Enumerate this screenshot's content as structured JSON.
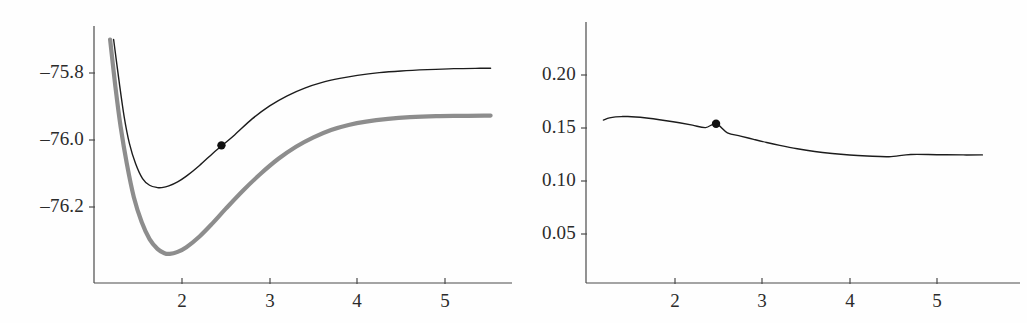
{
  "figure": {
    "background": "#fefefe",
    "panel_count": 2
  },
  "chart_data": [
    {
      "type": "line",
      "panel": "left",
      "title": "",
      "xlabel": "",
      "ylabel": "",
      "xlim": [
        1.15,
        5.55
      ],
      "ylim": [
        -76.36,
        -75.7
      ],
      "grid": false,
      "legend": "none",
      "xticks": [
        2,
        3,
        4,
        5
      ],
      "xtick_labels": [
        "2",
        "3",
        "4",
        "5"
      ],
      "yticks": [
        -75.8,
        -76.0,
        -76.2
      ],
      "ytick_labels": [
        "–75.8",
        "–76.0",
        "–76.2"
      ],
      "series": [
        {
          "name": "upper-curve",
          "style": "thin-black",
          "color": "#1c1c1c",
          "width": 1.4,
          "x": [
            1.22,
            1.28,
            1.34,
            1.4,
            1.47,
            1.55,
            1.63,
            1.72,
            1.77,
            1.85,
            1.95,
            2.05,
            2.2,
            2.35,
            2.45,
            2.6,
            2.8,
            3.0,
            3.2,
            3.4,
            3.6,
            3.8,
            4.0,
            4.25,
            4.5,
            4.8,
            5.1,
            5.4,
            5.52
          ],
          "y": [
            -75.7,
            -75.82,
            -75.93,
            -76.01,
            -76.07,
            -76.115,
            -76.135,
            -76.142,
            -76.142,
            -76.137,
            -76.125,
            -76.108,
            -76.076,
            -76.04,
            -76.018,
            -75.985,
            -75.937,
            -75.898,
            -75.868,
            -75.845,
            -75.828,
            -75.816,
            -75.807,
            -75.799,
            -75.794,
            -75.79,
            -75.787,
            -75.786,
            -75.786
          ]
        },
        {
          "name": "lower-curve",
          "style": "thick-gray",
          "color": "#8d8d8d",
          "width": 4.2,
          "x": [
            1.18,
            1.24,
            1.3,
            1.37,
            1.45,
            1.54,
            1.63,
            1.72,
            1.8,
            1.86,
            1.95,
            2.05,
            2.2,
            2.35,
            2.5,
            2.7,
            2.9,
            3.1,
            3.3,
            3.5,
            3.7,
            3.9,
            4.1,
            4.35,
            4.6,
            4.9,
            5.2,
            5.45,
            5.52
          ],
          "y": [
            -75.7,
            -75.84,
            -75.96,
            -76.07,
            -76.17,
            -76.245,
            -76.296,
            -76.325,
            -76.338,
            -76.34,
            -76.334,
            -76.32,
            -76.288,
            -76.248,
            -76.205,
            -76.15,
            -76.1,
            -76.056,
            -76.02,
            -75.992,
            -75.97,
            -75.955,
            -75.945,
            -75.937,
            -75.932,
            -75.929,
            -75.928,
            -75.927,
            -75.927
          ]
        }
      ],
      "markers": [
        {
          "name": "equilibrium-point",
          "x": 2.45,
          "y": -76.016,
          "color": "#111111",
          "radius": 4.2,
          "series": "upper-curve"
        }
      ]
    },
    {
      "type": "line",
      "panel": "right",
      "title": "",
      "xlabel": "",
      "ylabel": "",
      "xlim": [
        1.15,
        5.55
      ],
      "ylim": [
        0.0,
        0.235
      ],
      "grid": false,
      "legend": "none",
      "xticks": [
        2,
        3,
        4,
        5
      ],
      "xtick_labels": [
        "2",
        "3",
        "4",
        "5"
      ],
      "yticks": [
        0.2,
        0.15,
        0.1,
        0.05
      ],
      "ytick_labels": [
        "0.20",
        "0.15",
        "0.10",
        "0.05"
      ],
      "series": [
        {
          "name": "dipole-curve",
          "style": "thin-black",
          "color": "#1c1c1c",
          "width": 1.4,
          "x": [
            1.18,
            1.25,
            1.32,
            1.4,
            1.46,
            1.55,
            1.65,
            1.75,
            1.9,
            2.05,
            2.2,
            2.35,
            2.47,
            2.6,
            2.75,
            2.9,
            3.05,
            3.2,
            3.4,
            3.6,
            3.8,
            4.0,
            4.2,
            4.45,
            4.7,
            5.0,
            5.3,
            5.52
          ],
          "y": [
            0.1575,
            0.1595,
            0.1605,
            0.1608,
            0.1608,
            0.1604,
            0.1597,
            0.1587,
            0.1569,
            0.1549,
            0.1527,
            0.1504,
            0.154,
            0.1455,
            0.1424,
            0.1393,
            0.1363,
            0.1336,
            0.1304,
            0.1278,
            0.1259,
            0.1245,
            0.1236,
            0.1229,
            0.125,
            0.1248,
            0.1246,
            0.1246
          ]
        }
      ],
      "markers": [
        {
          "name": "equilibrium-point",
          "x": 2.47,
          "y": 0.154,
          "color": "#111111",
          "radius": 4.2,
          "series": "dipole-curve"
        }
      ]
    }
  ],
  "panel_left": {
    "axis": {
      "color": "#4a4a4a",
      "x_origin_px": 94,
      "y_origin_px": 283,
      "x_end_px": 512,
      "y_top_px": 26
    },
    "ytick_labels": [
      {
        "text": "–75.8",
        "y_px": 73
      },
      {
        "text": "–76.0",
        "y_px": 140
      },
      {
        "text": "–76.2",
        "y_px": 207
      }
    ],
    "xtick_labels": [
      {
        "text": "2",
        "x_px": 182
      },
      {
        "text": "3",
        "x_px": 270
      },
      {
        "text": "4",
        "x_px": 357
      },
      {
        "text": "5",
        "x_px": 445
      }
    ]
  },
  "panel_right": {
    "axis": {
      "color": "#4a4a4a",
      "x_origin_px": 66,
      "y_origin_px": 283,
      "x_end_px": 500,
      "y_top_px": 22
    },
    "ytick_labels": [
      {
        "text": "0.20",
        "y_px": 75
      },
      {
        "text": "0.15",
        "y_px": 128
      },
      {
        "text": "0.10",
        "y_px": 181
      },
      {
        "text": "0.05",
        "y_px": 234
      }
    ],
    "xtick_labels": [
      {
        "text": "2",
        "x_px": 155
      },
      {
        "text": "3",
        "x_px": 242
      },
      {
        "text": "4",
        "x_px": 330
      },
      {
        "text": "5",
        "x_px": 417
      }
    ]
  }
}
